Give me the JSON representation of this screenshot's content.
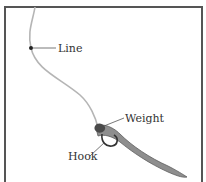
{
  "diagram": {
    "labels": {
      "line": "Line",
      "weight": "Weight",
      "hook": "Hook"
    },
    "colors": {
      "frame": "#555555",
      "line": "#b0b0b0",
      "worm": "#8a8a8a",
      "worm_outline": "#5a5a5a",
      "weight": "#444444",
      "leader": "#333333",
      "text": "#333333",
      "background": "#ffffff"
    }
  }
}
